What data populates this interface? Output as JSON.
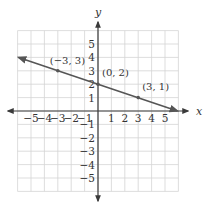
{
  "chart_data": {
    "type": "line",
    "title": "",
    "xlabel": "x",
    "ylabel": "y",
    "xlim": [
      -6,
      6
    ],
    "ylim": [
      -6,
      6
    ],
    "grid": true,
    "x_ticks": [
      -5,
      -4,
      -3,
      -2,
      -1,
      1,
      2,
      3,
      4,
      5
    ],
    "y_ticks": [
      -5,
      -4,
      -3,
      -2,
      -1,
      1,
      2,
      3,
      4,
      5
    ],
    "x_tick_labels": [
      "−5",
      "−4",
      "−3",
      "−2",
      "−1",
      "1",
      "2",
      "3",
      "4",
      "5"
    ],
    "y_tick_labels": [
      "−5",
      "−4",
      "−3",
      "−2",
      "−1",
      "1",
      "2",
      "3",
      "4",
      "5"
    ],
    "series": [
      {
        "name": "line",
        "equation": "y = -x/3 + 2",
        "x": [
          -6,
          6
        ],
        "y": [
          4,
          0
        ],
        "arrows_both_ends": true
      }
    ],
    "points": [
      {
        "x": -3,
        "y": 3,
        "label": "(−3, 3)"
      },
      {
        "x": 0,
        "y": 2,
        "label": "(0, 2)"
      },
      {
        "x": 3,
        "y": 1,
        "label": "(3, 1)"
      }
    ]
  },
  "colors": {
    "grid": "#d4d4d4",
    "axis": "#3a3a3a",
    "line": "#555555",
    "text": "#333333"
  }
}
